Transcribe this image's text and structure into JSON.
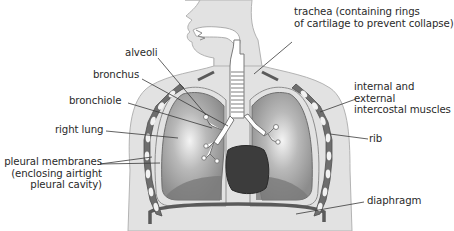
{
  "diagram": {
    "colors": {
      "background": "#ffffff",
      "body_fill": "#e2e2e2",
      "body_outline": "#b0b0b0",
      "rib_fill": "#6e6e6e",
      "rib_hole": "#f2f2f2",
      "lung_fill": "#9a9a9a",
      "lung_highlight": "#f4f4f4",
      "heart_fill": "#3c3c3c",
      "leader_line": "#3a3a3a",
      "label_text": "#2a2a2a"
    },
    "labels": {
      "alveoli": {
        "lines": [
          "alveoli"
        ]
      },
      "bronchus": {
        "lines": [
          "bronchus"
        ]
      },
      "bronchiole": {
        "lines": [
          "bronchiole"
        ]
      },
      "right_lung": {
        "lines": [
          "right lung"
        ]
      },
      "pleural_membranes": {
        "lines": [
          "pleural membranes",
          "(enclosing airtight",
          "pleural cavity)"
        ]
      },
      "trachea": {
        "lines": [
          "trachea (containing rings",
          "of cartilage to prevent collapse)"
        ]
      },
      "intercostal_muscles": {
        "lines": [
          "internal and",
          "external",
          "intercostal muscles"
        ]
      },
      "rib": {
        "lines": [
          "rib"
        ]
      },
      "diaphragm": {
        "lines": [
          "diaphragm"
        ]
      }
    }
  }
}
